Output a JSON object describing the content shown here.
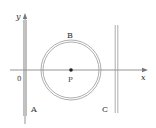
{
  "diagram": {
    "axes": {
      "x_label": "x",
      "y_label": "y",
      "origin_label": "0"
    },
    "wires": [
      {
        "label": "A",
        "type": "straight-vertical",
        "position": "along y-axis"
      },
      {
        "label": "B",
        "type": "circular-loop",
        "center_label": "P"
      },
      {
        "label": "C",
        "type": "straight-vertical",
        "position": "right of loop"
      }
    ],
    "center_point": {
      "label": "P"
    },
    "colors": {
      "line": "#888888",
      "text": "#333333"
    }
  }
}
